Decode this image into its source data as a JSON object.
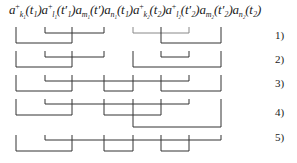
{
  "formula": {
    "terms": [
      {
        "op": "a",
        "sup": "+",
        "sub": "k₁",
        "arg": "(t₁)"
      },
      {
        "op": "a",
        "sup": "+",
        "sub": "l₁",
        "arg": "(t′₁)"
      },
      {
        "op": "a",
        "sup": "",
        "sub": "m₁",
        "arg": "(t′)"
      },
      {
        "op": "a",
        "sup": "",
        "sub": "n₁",
        "arg": "(t₁)"
      },
      {
        "op": "a",
        "sup": "+",
        "sub": "k₂",
        "arg": "(t₂)"
      },
      {
        "op": "a",
        "sup": "+",
        "sub": "l₂",
        "arg": "(t′₂)"
      },
      {
        "op": "a",
        "sup": "",
        "sub": "m₂",
        "arg": "(t′₂)"
      },
      {
        "op": "a",
        "sup": "",
        "sub": "n₂",
        "arg": "(t₂)"
      }
    ]
  },
  "contractions": [
    {
      "label": "1)",
      "pairs": [
        [
          0,
          2
        ],
        [
          1,
          3
        ],
        [
          4,
          6
        ],
        [
          5,
          7
        ]
      ]
    },
    {
      "label": "2)",
      "pairs": [
        [
          0,
          2
        ],
        [
          1,
          3
        ],
        [
          4,
          7
        ],
        [
          5,
          6
        ]
      ]
    },
    {
      "label": "3)",
      "pairs": [
        [
          0,
          2
        ],
        [
          1,
          6
        ],
        [
          3,
          4
        ],
        [
          5,
          7
        ]
      ]
    },
    {
      "label": "4)",
      "pairs": [
        [
          0,
          2
        ],
        [
          1,
          6
        ],
        [
          3,
          5
        ],
        [
          4,
          7
        ]
      ]
    },
    {
      "label": "5)",
      "pairs": [
        [
          0,
          2
        ],
        [
          1,
          7
        ],
        [
          3,
          4
        ],
        [
          5,
          6
        ]
      ]
    }
  ],
  "labels": {
    "r1": "1)",
    "r2": "2)",
    "r3": "3)",
    "r4": "4)",
    "r5": "5)"
  }
}
